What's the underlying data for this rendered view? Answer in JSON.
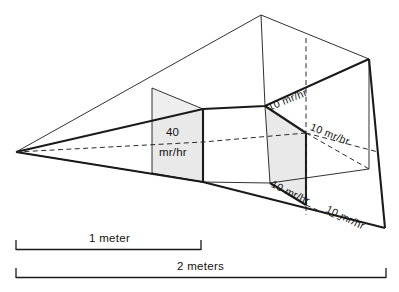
{
  "figure": {
    "kind": "radiation-dose-field-perspective-diagram",
    "background_color": "#ffffff",
    "line_color": "#1a1a1a",
    "panel_fill_color": "#e9e9e9"
  },
  "near_panel": {
    "dose_value": "40",
    "dose_unit": "mr/hr",
    "distance_label": "1 meter"
  },
  "far_panel": {
    "dose_unit": "mr/hr",
    "distance_label": "2 meters",
    "labels": [
      {
        "text": "10 mr/hr",
        "rotation_deg": -22
      },
      {
        "text": "10 mr/hr",
        "rotation_deg": 22
      },
      {
        "text": "10 mr/hr",
        "rotation_deg": 26
      },
      {
        "text": "10 mr/hr",
        "rotation_deg": 26
      }
    ]
  },
  "scale_bars": [
    {
      "id": "one-meter",
      "label": "1 meter"
    },
    {
      "id": "two-meters",
      "label": "2 meters"
    }
  ],
  "geometry": {
    "apex": [
      16,
      152
    ],
    "near_panel_x_range": [
      152,
      203
    ],
    "far_panel_x_range": [
      265,
      306
    ],
    "top_apex": [
      261,
      15
    ],
    "right_top": [
      369,
      59
    ],
    "right_bottom": [
      385,
      228
    ]
  }
}
